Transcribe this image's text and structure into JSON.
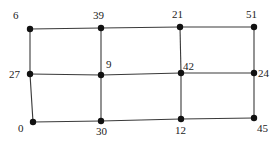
{
  "diagram": {
    "type": "grid-graph",
    "rows": 3,
    "cols": 4,
    "nodes": [
      {
        "id": "r0c0",
        "value": "6",
        "x": 30,
        "y": 29,
        "lx": 13,
        "ly": 19
      },
      {
        "id": "r0c1",
        "value": "39",
        "x": 101,
        "y": 28,
        "lx": 93,
        "ly": 19
      },
      {
        "id": "r0c2",
        "value": "21",
        "x": 180,
        "y": 27,
        "lx": 172,
        "ly": 18
      },
      {
        "id": "r0c3",
        "value": "51",
        "x": 254,
        "y": 27,
        "lx": 246,
        "ly": 18
      },
      {
        "id": "r1c0",
        "value": "27",
        "x": 30,
        "y": 74,
        "lx": 9,
        "ly": 78
      },
      {
        "id": "r1c1",
        "value": "9",
        "x": 101,
        "y": 75,
        "lx": 106,
        "ly": 68
      },
      {
        "id": "r1c2",
        "value": "42",
        "x": 181,
        "y": 73,
        "lx": 183,
        "ly": 70
      },
      {
        "id": "r1c3",
        "value": "24",
        "x": 254,
        "y": 73,
        "lx": 258,
        "ly": 77
      },
      {
        "id": "r2c0",
        "value": "0",
        "x": 33,
        "y": 122,
        "lx": 18,
        "ly": 132
      },
      {
        "id": "r2c1",
        "value": "30",
        "x": 101,
        "y": 121,
        "lx": 96,
        "ly": 135
      },
      {
        "id": "r2c2",
        "value": "12",
        "x": 181,
        "y": 119,
        "lx": 175,
        "ly": 134
      },
      {
        "id": "r2c3",
        "value": "45",
        "x": 254,
        "y": 118,
        "lx": 257,
        "ly": 132
      }
    ],
    "edges": [
      [
        "r0c0",
        "r0c1"
      ],
      [
        "r0c1",
        "r0c2"
      ],
      [
        "r0c2",
        "r0c3"
      ],
      [
        "r1c0",
        "r1c1"
      ],
      [
        "r1c1",
        "r1c2"
      ],
      [
        "r1c2",
        "r1c3"
      ],
      [
        "r2c0",
        "r2c1"
      ],
      [
        "r2c1",
        "r2c2"
      ],
      [
        "r2c2",
        "r2c3"
      ],
      [
        "r0c0",
        "r1c0"
      ],
      [
        "r1c0",
        "r2c0"
      ],
      [
        "r0c1",
        "r1c1"
      ],
      [
        "r1c1",
        "r2c1"
      ],
      [
        "r0c2",
        "r1c2"
      ],
      [
        "r1c2",
        "r2c2"
      ],
      [
        "r0c3",
        "r1c3"
      ],
      [
        "r1c3",
        "r2c3"
      ]
    ],
    "colors": {
      "edge": "#3a3a3a",
      "node": "#111111",
      "label": "#222222",
      "background": "#ffffff"
    }
  }
}
